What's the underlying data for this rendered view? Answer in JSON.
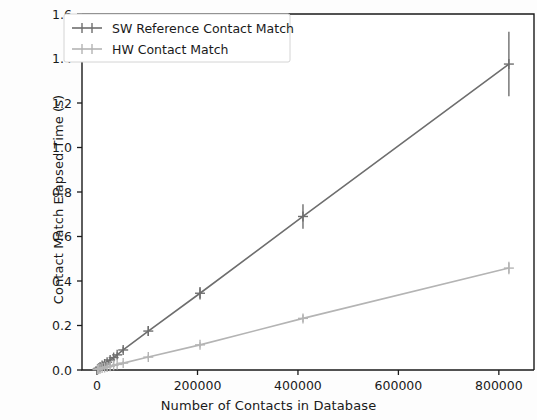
{
  "chart_data": {
    "type": "line",
    "title": "",
    "xlabel": "Number of Contacts in Database",
    "ylabel": "Contact Match Elapsed Time (s)",
    "xlim": [
      -30000,
      870000
    ],
    "ylim": [
      0.0,
      1.6
    ],
    "xticks": [
      0,
      200000,
      400000,
      600000,
      800000
    ],
    "xtick_labels": [
      "0",
      "200000",
      "400000",
      "600000",
      "800000"
    ],
    "yticks": [
      0.0,
      0.2,
      0.4,
      0.6,
      0.8,
      1.0,
      1.2,
      1.4,
      1.6
    ],
    "ytick_labels": [
      "0.0",
      "0.2",
      "0.4",
      "0.6",
      "0.8",
      "1.0",
      "1.2",
      "1.4",
      "1.6"
    ],
    "grid": false,
    "legend_position": "upper left",
    "error_bars": true,
    "marker": "plus",
    "series": [
      {
        "name": "SW Reference Contact Match",
        "color": "#6e6e6e",
        "x": [
          1000,
          3000,
          6000,
          10000,
          15000,
          20000,
          26000,
          33000,
          40000,
          52000,
          102000,
          205000,
          410000,
          820000
        ],
        "y": [
          0.004,
          0.008,
          0.013,
          0.02,
          0.027,
          0.035,
          0.045,
          0.056,
          0.068,
          0.09,
          0.175,
          0.345,
          0.69,
          1.375
        ],
        "yerr": [
          0.004,
          0.005,
          0.006,
          0.007,
          0.008,
          0.009,
          0.01,
          0.011,
          0.012,
          0.014,
          0.022,
          0.028,
          0.055,
          0.145
        ]
      },
      {
        "name": "HW Contact Match",
        "color": "#b4b4b4",
        "x": [
          1000,
          3000,
          6000,
          10000,
          15000,
          20000,
          26000,
          33000,
          40000,
          52000,
          102000,
          205000,
          410000,
          820000
        ],
        "y": [
          0.002,
          0.004,
          0.006,
          0.009,
          0.011,
          0.014,
          0.017,
          0.021,
          0.025,
          0.031,
          0.058,
          0.113,
          0.232,
          0.458
        ],
        "yerr": [
          0.003,
          0.004,
          0.004,
          0.005,
          0.005,
          0.006,
          0.006,
          0.007,
          0.007,
          0.008,
          0.01,
          0.012,
          0.016,
          0.028
        ]
      }
    ]
  },
  "legend": {
    "entries": [
      {
        "label": "SW Reference Contact Match"
      },
      {
        "label": "HW Contact Match"
      }
    ]
  }
}
